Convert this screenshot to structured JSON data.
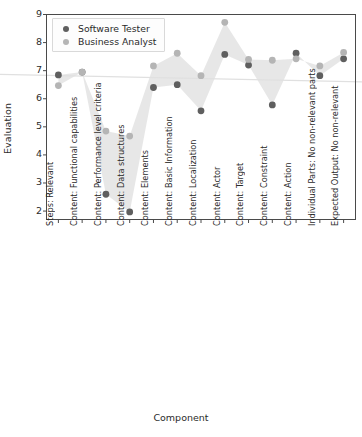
{
  "chart_data": {
    "type": "scatter",
    "title": "",
    "xlabel": "Component",
    "ylabel": "Evaluation",
    "ylim": [
      1.7,
      9.0
    ],
    "yticks": [
      2,
      3,
      4,
      5,
      6,
      7,
      8,
      9
    ],
    "grid": false,
    "legend_position": "upper left",
    "categories": [
      "Steps: Relevant",
      "Content: Functional capabilities",
      "Content: Performance level criteria",
      "Content: Data structures",
      "Content: Elements",
      "Content: Basic Information",
      "Content: Localization",
      "Content: Actor",
      "Content: Target",
      "Content: Constraint",
      "Content: Action",
      "Individual Parts: No non-relevant parts",
      "Expected Output: No non-relevant"
    ],
    "series": [
      {
        "name": "Software Tester",
        "color": "#5f5f5f",
        "values": [
          6.85,
          6.95,
          2.6,
          1.97,
          6.4,
          6.5,
          5.57,
          7.58,
          7.2,
          5.78,
          7.62,
          6.82,
          7.42
        ]
      },
      {
        "name": "Business Analyst",
        "color": "#b5b5b5",
        "values": [
          6.47,
          6.95,
          4.85,
          4.67,
          7.17,
          7.62,
          6.82,
          8.72,
          7.4,
          7.37,
          7.42,
          7.17,
          7.65
        ]
      }
    ],
    "band": {
      "name": "between-series-band",
      "fill": "#e3e3e3"
    },
    "reference_line": {
      "name": "trend-line",
      "color": "#e0e0e0",
      "y_start": 6.87,
      "y_end": 6.6
    },
    "axis_color": "#4a4a4a"
  }
}
